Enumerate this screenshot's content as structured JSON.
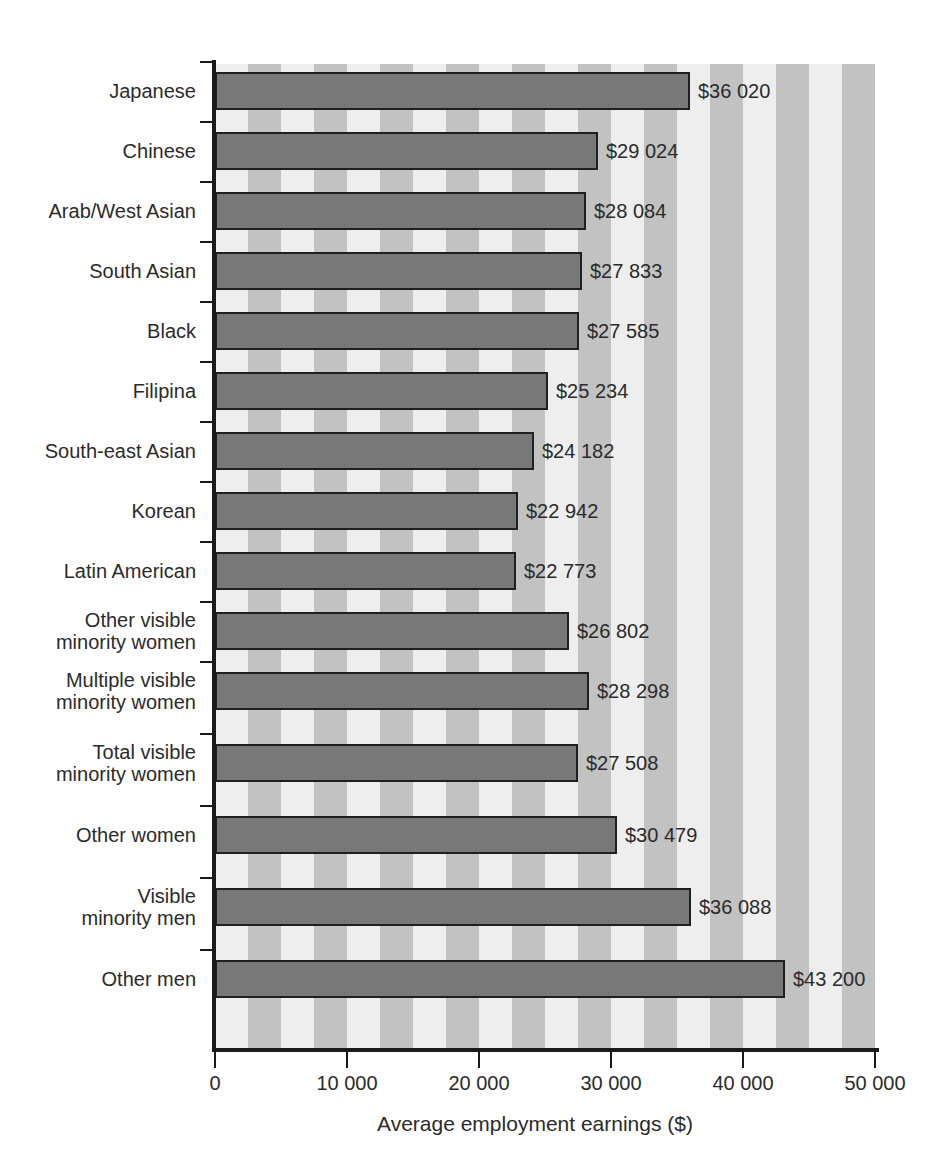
{
  "chart_data": {
    "type": "bar",
    "orientation": "horizontal",
    "title": "",
    "xlabel": "Average employment earnings ($)",
    "ylabel": "",
    "xlim": [
      0,
      50000
    ],
    "xticks": [
      0,
      10000,
      20000,
      30000,
      40000,
      50000
    ],
    "xtick_labels": [
      "0",
      "10 000",
      "20 000",
      "30 000",
      "40 000",
      "50 000"
    ],
    "grid": false,
    "legend": null,
    "categories": [
      "Japanese",
      "Chinese",
      "Arab/West Asian",
      "South Asian",
      "Black",
      "Filipina",
      "South-east Asian",
      "Korean",
      "Latin American",
      "Other visible minority women",
      "Multiple visible minority women",
      "Total visible minority women",
      "Other women",
      "Visible minority men",
      "Other men"
    ],
    "values": [
      36020,
      29024,
      28084,
      27833,
      27585,
      25234,
      24182,
      22942,
      22773,
      26802,
      28298,
      27508,
      30479,
      36088,
      43200
    ],
    "value_labels": [
      "$36 020",
      "$29 024",
      "$28 084",
      "$27 833",
      "$27 585",
      "$25 234",
      "$24 182",
      "$22 942",
      "$22 773",
      "$26 802",
      "$28 298",
      "$27 508",
      "$30 479",
      "$36 088",
      "$43 200"
    ]
  },
  "rows": [
    {
      "label_line1": "Japanese",
      "label_line2": "",
      "value_label": "$36 020",
      "value": 36020
    },
    {
      "label_line1": "Chinese",
      "label_line2": "",
      "value_label": "$29 024",
      "value": 29024
    },
    {
      "label_line1": "Arab/West Asian",
      "label_line2": "",
      "value_label": "$28 084",
      "value": 28084
    },
    {
      "label_line1": "South Asian",
      "label_line2": "",
      "value_label": "$27 833",
      "value": 27833
    },
    {
      "label_line1": "Black",
      "label_line2": "",
      "value_label": "$27 585",
      "value": 27585
    },
    {
      "label_line1": "Filipina",
      "label_line2": "",
      "value_label": "$25 234",
      "value": 25234
    },
    {
      "label_line1": "South-east Asian",
      "label_line2": "",
      "value_label": "$24 182",
      "value": 24182
    },
    {
      "label_line1": "Korean",
      "label_line2": "",
      "value_label": "$22 942",
      "value": 22942
    },
    {
      "label_line1": "Latin American",
      "label_line2": "",
      "value_label": "$22 773",
      "value": 22773
    },
    {
      "label_line1": "Other visible",
      "label_line2": "minority women",
      "value_label": "$26 802",
      "value": 26802
    },
    {
      "label_line1": "Multiple visible",
      "label_line2": "minority women",
      "value_label": "$28 298",
      "value": 28298
    },
    {
      "label_line1": "Total visible",
      "label_line2": "minority women",
      "value_label": "$27 508",
      "value": 27508
    },
    {
      "label_line1": "Other women",
      "label_line2": "",
      "value_label": "$30 479",
      "value": 30479
    },
    {
      "label_line1": "Visible",
      "label_line2": "minority men",
      "value_label": "$36 088",
      "value": 36088
    },
    {
      "label_line1": "Other men",
      "label_line2": "",
      "value_label": "$43 200",
      "value": 43200
    }
  ],
  "axis": {
    "x_title": "Average employment earnings ($)",
    "x_tick_labels": [
      "0",
      "10 000",
      "20 000",
      "30 000",
      "40 000",
      "50 000"
    ]
  },
  "colors": {
    "bar_fill": "#787878",
    "bar_border": "#1f1f1f",
    "stripe_light": "#eeeeee",
    "stripe_dark": "#c2c2c2",
    "axis": "#1a1a1a",
    "text": "#2b2b2b"
  }
}
